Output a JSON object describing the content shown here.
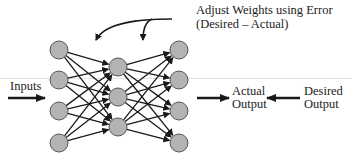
{
  "diagram": {
    "labels": {
      "adjust_line1": "Adjust Weights using Error",
      "adjust_line2": "(Desired – Actual)",
      "inputs": "Inputs",
      "actual_line1": "Actual",
      "actual_line2": "Output",
      "desired_line1": "Desired",
      "desired_line2": "Output"
    },
    "layers": {
      "input": {
        "x": 59,
        "nodes": [
          50,
          80,
          111,
          143
        ]
      },
      "hidden": {
        "x": 118,
        "nodes": [
          67,
          97,
          127
        ]
      },
      "output": {
        "x": 179,
        "nodes": [
          50,
          80,
          111,
          143
        ]
      }
    },
    "node_radius": 9,
    "colors": {
      "node_fill": "#b3b3b3",
      "node_stroke": "#555555",
      "edge": "#1a1a1a",
      "text": "#222222"
    }
  }
}
